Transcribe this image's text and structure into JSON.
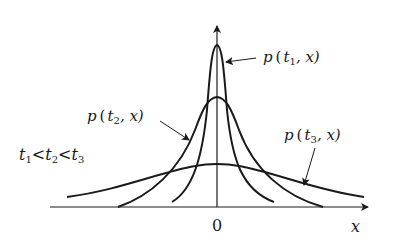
{
  "diagram": {
    "title": "",
    "labels": {
      "curve1_func": "p",
      "curve1_args_open": "(",
      "curve1_t": "t",
      "curve1_sub": "1",
      "curve1_rest": ", x)",
      "curve2_func": "p",
      "curve2_args_open": "(",
      "curve2_t": "t",
      "curve2_sub": "2",
      "curve2_rest": ", x)",
      "curve3_func": "p",
      "curve3_args_open": "(",
      "curve3_t": "t",
      "curve3_sub": "3",
      "curve3_rest": ", x)",
      "order_t1": "t",
      "order_s1": "1",
      "order_lt1": "<",
      "order_t2": "t",
      "order_s2": "2",
      "order_lt2": "<",
      "order_t3": "t",
      "order_s3": "3",
      "origin": "0",
      "x_axis": "x"
    },
    "curves": [
      {
        "name": "p(t1,x)",
        "peak_height": "tallest, narrowest"
      },
      {
        "name": "p(t2,x)",
        "peak_height": "medium"
      },
      {
        "name": "p(t3,x)",
        "peak_height": "lowest, widest"
      }
    ],
    "colors": {
      "ink": "#1a1a1a",
      "background": "#ffffff"
    }
  }
}
